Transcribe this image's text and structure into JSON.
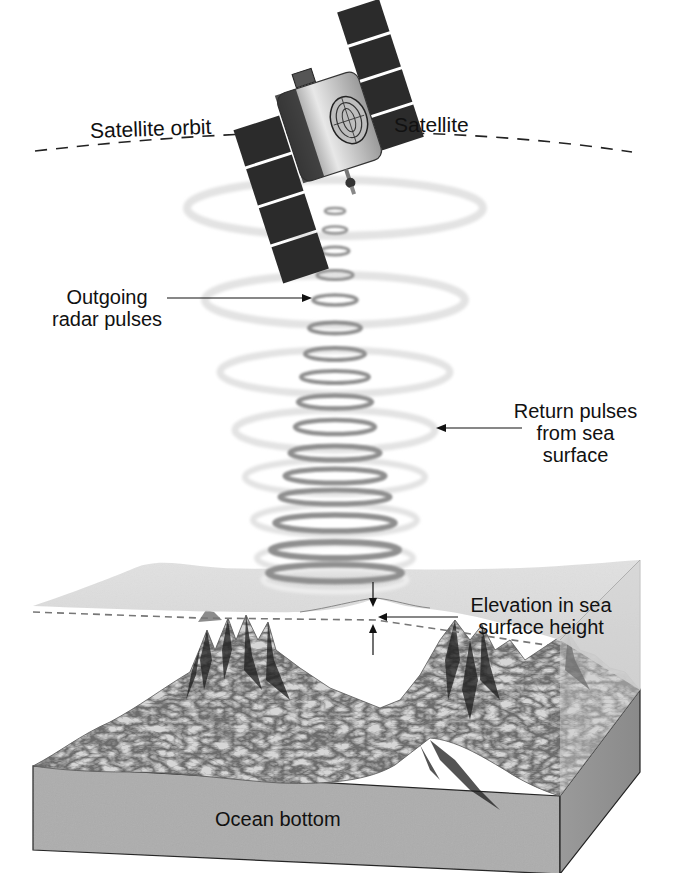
{
  "diagram": {
    "type": "satellite-altimetry-illustration",
    "labels": {
      "satellite": "Satellite",
      "satellite_orbit": "Satellite orbit",
      "outgoing_pulses": "Outgoing\nradar pulses",
      "return_pulses": "Return pulses\nfrom sea\nsurface",
      "elevation": "Elevation in sea\nsurface height",
      "ocean_bottom": "Ocean bottom"
    },
    "components": [
      {
        "id": "satellite",
        "description": "Satellite with two solar panel wings and a radar antenna pointing down"
      },
      {
        "id": "orbit",
        "description": "Dashed arc representing the satellite orbit"
      },
      {
        "id": "outgoing-pulses",
        "description": "Stack of small dark ellipses traveling downward from the satellite"
      },
      {
        "id": "return-pulses",
        "description": "Large faint ellipses reflecting back up from the sea surface"
      },
      {
        "id": "sea-surface",
        "description": "Semi-transparent grey water surface with a bulge over the seamount"
      },
      {
        "id": "reference-line",
        "description": "Dashed line showing the mean sea surface level"
      },
      {
        "id": "elevation-arrows",
        "description": "Pair of opposing arrows marking the sea surface elevation"
      },
      {
        "id": "seafloor",
        "description": "Block cutaway of ocean floor with mountains / seamounts"
      }
    ],
    "colors": {
      "text": "#111111",
      "panel": "#2a2a2a",
      "pulse_dark": "#8e8e8e",
      "pulse_faint": "#e6e6e6",
      "water": "#d4d4d4",
      "block_side": "#a9a9a9",
      "block_right": "#8f8f8f",
      "terrain": "#cfcfcf"
    }
  }
}
